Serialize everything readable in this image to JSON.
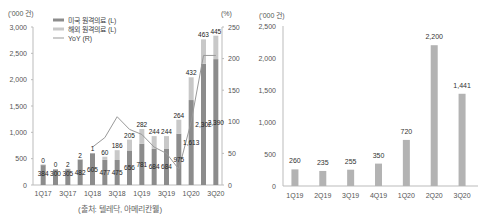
{
  "chart_data": [
    {
      "type": "bar",
      "stacked": true,
      "title": "",
      "left_unit": "('000 건)",
      "right_unit": "(%)",
      "categories": [
        "1Q17",
        "2Q17",
        "3Q17",
        "4Q17",
        "1Q18",
        "2Q18",
        "3Q18",
        "4Q18",
        "1Q19",
        "2Q19",
        "3Q19",
        "4Q19",
        "1Q20",
        "2Q20",
        "3Q20"
      ],
      "x_tick_labels": [
        "1Q17",
        "3Q17",
        "1Q18",
        "3Q18",
        "1Q19",
        "3Q19",
        "1Q20",
        "3Q20"
      ],
      "series": [
        {
          "name": "미국 원격의료 (L)",
          "axis": "left",
          "color": "#8c8c8c",
          "values": [
            384,
            300,
            305,
            482,
            605,
            477,
            475,
            656,
            781,
            684,
            684,
            975,
            1613,
            2302,
            2390
          ]
        },
        {
          "name": "해외 원격의료 (L)",
          "axis": "left",
          "color": "#c8c8c8",
          "values": [
            0,
            0,
            2,
            2,
            1,
            60,
            186,
            205,
            282,
            244,
            244,
            264,
            432,
            463,
            445
          ]
        },
        {
          "name": "YoY (R)",
          "axis": "right",
          "type": "line",
          "color": "#999999",
          "values": [
            null,
            null,
            null,
            null,
            60,
            75,
            108,
            88,
            80,
            60,
            50,
            25,
            100,
            205,
            205
          ]
        }
      ],
      "value_labels_bottom": [
        "384",
        "300",
        "305",
        "482",
        "605",
        "477",
        "475",
        "656",
        "781",
        "684",
        "684",
        "975",
        "1,613",
        "2,302",
        "2,390"
      ],
      "value_labels_top": [
        "0",
        "0",
        "2",
        "2",
        "1",
        "60",
        "186",
        "205",
        "282",
        "244",
        "244",
        "264",
        "432",
        "463",
        "445"
      ],
      "ylim_left": [
        0,
        3000
      ],
      "yticks_left": [
        "0",
        "500",
        "1,000",
        "1,500",
        "2,000",
        "2,500",
        "3,000"
      ],
      "ylim_right": [
        0,
        250
      ],
      "yticks_right": [
        "0",
        "50",
        "100",
        "150",
        "200",
        "250"
      ],
      "legend_position": "top-left",
      "grid": false
    },
    {
      "type": "bar",
      "title": "",
      "unit": "('000 건)",
      "categories": [
        "1Q19",
        "2Q19",
        "3Q19",
        "4Q19",
        "1Q20",
        "2Q20",
        "3Q20"
      ],
      "values": [
        260,
        235,
        255,
        350,
        720,
        2200,
        1441
      ],
      "value_labels": [
        "260",
        "235",
        "255",
        "350",
        "720",
        "2,200",
        "1,441"
      ],
      "color": "#b3b3b3",
      "ylim": [
        0,
        2500
      ],
      "yticks": [
        "0",
        "500",
        "1,000",
        "1,500",
        "2,000",
        "2,500"
      ],
      "grid": false
    }
  ],
  "source": "(출처: 텔레닥, 아메리칸웰)"
}
